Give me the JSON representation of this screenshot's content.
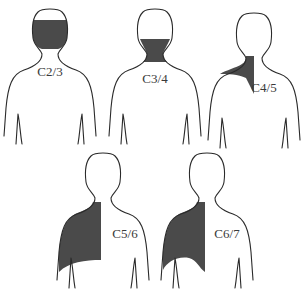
{
  "figure": {
    "type": "dermatome-pain-referral-diagram",
    "view": "posterior",
    "shade_color": "#4a4a4a",
    "outline_color": "#2a2a2a",
    "panels": [
      {
        "label": "C2/3",
        "region": "occipital head",
        "row": 1,
        "col": 1
      },
      {
        "label": "C3/4",
        "region": "posterior neck",
        "row": 1,
        "col": 2
      },
      {
        "label": "C4/5",
        "region": "neck base to upper shoulder",
        "row": 1,
        "col": 3
      },
      {
        "label": "C5/6",
        "region": "shoulder and scapular region",
        "row": 2,
        "col": 1
      },
      {
        "label": "C6/7",
        "region": "shoulder and scapular region",
        "row": 2,
        "col": 2
      }
    ]
  }
}
